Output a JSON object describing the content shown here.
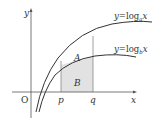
{
  "diagram": {
    "curves": [
      {
        "name": "upper",
        "label_prefix": "y=log",
        "base": "a",
        "var": "x"
      },
      {
        "name": "lower",
        "label_prefix": "y=log",
        "base": "b",
        "var": "x"
      }
    ],
    "axes": {
      "x_label": "x",
      "y_label": "y",
      "origin_label": "O"
    },
    "points": {
      "p": "p",
      "q": "q"
    },
    "regions": {
      "A": "A",
      "B": "B"
    },
    "colors": {
      "stroke": "#333333",
      "shade": "#e2e2e2",
      "guide": "#888888"
    }
  }
}
